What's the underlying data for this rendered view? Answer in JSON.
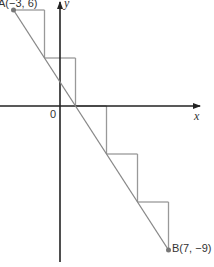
{
  "diagram": {
    "type": "coordinate-line-with-staircase",
    "axes": {
      "x_label": "x",
      "y_label": "y",
      "origin_label": "0"
    },
    "points": {
      "A": {
        "label": "A(−3, 6)",
        "x": -3,
        "y": 6
      },
      "B": {
        "label": "B(7, −9)",
        "x": 7,
        "y": -9
      }
    },
    "staircase": {
      "steps": 5,
      "run_per_step": 2,
      "rise_per_step": -3
    },
    "colors": {
      "axis": "#222222",
      "line": "#888888",
      "staircase": "#999999",
      "point": "#777777"
    }
  }
}
